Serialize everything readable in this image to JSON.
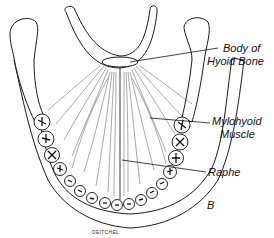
{
  "figure": {
    "panel_letter": "B",
    "artist_signature": "DEITCHEL",
    "labels": {
      "hyoid_line1": "Body of",
      "hyoid_line2": "Hyoid Bone",
      "mylohyoid_line1": "Mylohyoid",
      "mylohyoid_line2": "Muscle",
      "raphe": "Raphe"
    },
    "colors": {
      "ink": "#111111",
      "paper": "#ffffff"
    }
  }
}
